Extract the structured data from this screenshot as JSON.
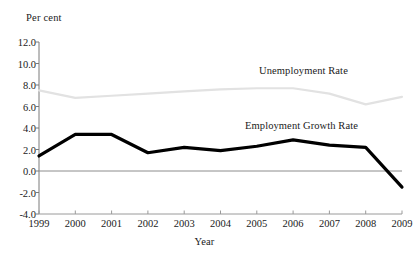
{
  "chart_data": {
    "type": "line",
    "title": "",
    "xlabel": "Year",
    "ylabel": "Per cent",
    "x": [
      1999,
      2000,
      2001,
      2002,
      2003,
      2004,
      2005,
      2006,
      2007,
      2008,
      2009
    ],
    "xtick_labels": [
      "1999",
      "2000",
      "2001",
      "2002",
      "2003",
      "2004",
      "2005",
      "2006",
      "2007",
      "2008",
      "2009"
    ],
    "ytick_labels": [
      "12.0",
      "10.0",
      "8.0",
      "6.0",
      "4.0",
      "2.0",
      "0.0",
      "-2.0",
      "-4.0"
    ],
    "ytick_values": [
      12.0,
      10.0,
      8.0,
      6.0,
      4.0,
      2.0,
      0.0,
      -2.0,
      -4.0
    ],
    "ylim": [
      -4.0,
      12.0
    ],
    "xlim": [
      1999,
      2009
    ],
    "grid": false,
    "legend_position": "inline-annotations",
    "zero_line": 0.0,
    "series": [
      {
        "name": "Unemployment Rate",
        "color": "#e2e2e2",
        "width": 2.2,
        "values": [
          7.5,
          6.8,
          7.0,
          7.2,
          7.4,
          7.6,
          7.7,
          7.7,
          7.2,
          6.2,
          6.9
        ]
      },
      {
        "name": "Employment Growth Rate",
        "color": "#000000",
        "width": 3.2,
        "values": [
          1.4,
          3.4,
          3.4,
          1.7,
          2.2,
          1.9,
          2.3,
          2.9,
          2.4,
          2.2,
          -1.5
        ]
      }
    ],
    "annotations": [
      {
        "text": "Unemployment Rate",
        "series": "Unemployment Rate"
      },
      {
        "text": "Employment Growth Rate",
        "series": "Employment Growth Rate"
      }
    ]
  },
  "axes": {
    "y_title": "Per cent",
    "x_title": "Year"
  }
}
